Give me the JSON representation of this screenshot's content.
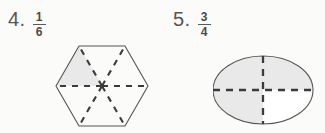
{
  "worksheet": {
    "background_color": "#fbfbfa",
    "ink_color": "#4a4a4a",
    "shade_color": "#e8e8e8",
    "problems": [
      {
        "number_label": "4.",
        "fraction": {
          "numerator": "1",
          "denominator": "6"
        },
        "shape": "hexagon",
        "parts_total": 6,
        "parts_shaded": 1,
        "shaded_sector_names": [
          "upper-left-sector"
        ],
        "divider_style": "dashed-radial"
      },
      {
        "number_label": "5.",
        "fraction": {
          "numerator": "3",
          "denominator": "4"
        },
        "shape": "ellipse",
        "parts_total": 4,
        "parts_shaded": 3,
        "shaded_sector_names": [
          "upper-left-quadrant",
          "upper-right-quadrant",
          "lower-left-quadrant"
        ],
        "divider_style": "dashed-cross"
      }
    ]
  }
}
